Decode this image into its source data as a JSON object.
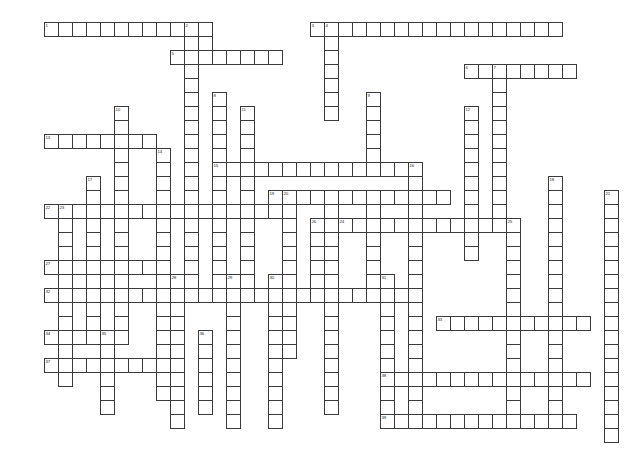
{
  "page": {
    "background_color": "#ffffff",
    "grid_line_color": "#3a3a3a",
    "cell_fill_color": "#ffffff",
    "number_color": "#2b2b2b"
  },
  "grid": {
    "origin_x": 44,
    "origin_y": 22,
    "cell_size": 14,
    "columns": 42,
    "rows": 30,
    "cell_count": 0
  },
  "entries": [
    {
      "number": "1",
      "direction": "across",
      "col": 0,
      "row": 0,
      "length": 11
    },
    {
      "number": "2",
      "direction": "down",
      "col": 10,
      "row": 0,
      "length": 12
    },
    {
      "number": "3",
      "direction": "across",
      "col": 19,
      "row": 0,
      "length": 18
    },
    {
      "number": "4",
      "direction": "down",
      "col": 20,
      "row": 0,
      "length": 6
    },
    {
      "number": "5",
      "direction": "across",
      "col": 9,
      "row": 2,
      "length": 8
    },
    {
      "number": "6",
      "direction": "across",
      "col": 30,
      "row": 3,
      "length": 8
    },
    {
      "number": "7",
      "direction": "down",
      "col": 32,
      "row": 3,
      "length": 9
    },
    {
      "number": "8",
      "direction": "down",
      "col": 12,
      "row": 5,
      "length": 14
    },
    {
      "number": "9",
      "direction": "down",
      "col": 23,
      "row": 5,
      "length": 6
    },
    {
      "number": "10",
      "direction": "down",
      "col": 5,
      "row": 6,
      "length": 15
    },
    {
      "number": "11",
      "direction": "down",
      "col": 14,
      "row": 6,
      "length": 14
    },
    {
      "number": "12",
      "direction": "down",
      "col": 30,
      "row": 6,
      "length": 11
    },
    {
      "number": "13",
      "direction": "across",
      "col": 0,
      "row": 8,
      "length": 8
    },
    {
      "number": "14",
      "direction": "down",
      "col": 8,
      "row": 9,
      "length": 18
    },
    {
      "number": "15",
      "direction": "across",
      "col": 12,
      "row": 10,
      "length": 15
    },
    {
      "number": "16",
      "direction": "down",
      "col": 26,
      "row": 10,
      "length": 14
    },
    {
      "number": "17",
      "direction": "down",
      "col": 3,
      "row": 11,
      "length": 11
    },
    {
      "number": "18",
      "direction": "down",
      "col": 36,
      "row": 11,
      "length": 14
    },
    {
      "number": "19",
      "direction": "across",
      "col": 16,
      "row": 12,
      "length": 13
    },
    {
      "number": "20",
      "direction": "down",
      "col": 17,
      "row": 12,
      "length": 12
    },
    {
      "number": "21",
      "direction": "down",
      "col": 40,
      "row": 12,
      "length": 13
    },
    {
      "number": "22",
      "direction": "across",
      "col": 0,
      "row": 13,
      "length": 17
    },
    {
      "number": "23",
      "direction": "down",
      "col": 1,
      "row": 13,
      "length": 13
    },
    {
      "number": "24",
      "direction": "across",
      "col": 21,
      "row": 14,
      "length": 13
    },
    {
      "number": "25",
      "direction": "down",
      "col": 33,
      "row": 14,
      "length": 12
    },
    {
      "number": "26",
      "direction": "down",
      "col": 19,
      "row": 14,
      "length": 5
    },
    {
      "number": "27",
      "direction": "across",
      "col": 0,
      "row": 17,
      "length": 8
    },
    {
      "number": "28",
      "direction": "down",
      "col": 9,
      "row": 18,
      "length": 11
    },
    {
      "number": "29",
      "direction": "down",
      "col": 13,
      "row": 18,
      "length": 11
    },
    {
      "number": "30",
      "direction": "down",
      "col": 16,
      "row": 18,
      "length": 11
    },
    {
      "number": "31",
      "direction": "down",
      "col": 24,
      "row": 18,
      "length": 10
    },
    {
      "number": "32",
      "direction": "across",
      "col": 0,
      "row": 19,
      "length": 26
    },
    {
      "number": "33",
      "direction": "across",
      "col": 28,
      "row": 21,
      "length": 11
    },
    {
      "number": "34",
      "direction": "across",
      "col": 0,
      "row": 22,
      "length": 6
    },
    {
      "number": "35",
      "direction": "down",
      "col": 4,
      "row": 22,
      "length": 6
    },
    {
      "number": "36",
      "direction": "down",
      "col": 11,
      "row": 22,
      "length": 6
    },
    {
      "number": "37",
      "direction": "across",
      "col": 0,
      "row": 24,
      "length": 10
    },
    {
      "number": "38",
      "direction": "across",
      "col": 24,
      "row": 25,
      "length": 15
    },
    {
      "number": "39",
      "direction": "across",
      "col": 24,
      "row": 28,
      "length": 14
    }
  ],
  "cells": [
    [
      0,
      0
    ],
    [
      1,
      0
    ],
    [
      2,
      0
    ],
    [
      3,
      0
    ],
    [
      4,
      0
    ],
    [
      5,
      0
    ],
    [
      6,
      0
    ],
    [
      7,
      0
    ],
    [
      8,
      0
    ],
    [
      9,
      0
    ],
    [
      10,
      0
    ],
    [
      11,
      0
    ],
    [
      19,
      0
    ],
    [
      20,
      0
    ],
    [
      21,
      0
    ],
    [
      22,
      0
    ],
    [
      23,
      0
    ],
    [
      24,
      0
    ],
    [
      25,
      0
    ],
    [
      26,
      0
    ],
    [
      27,
      0
    ],
    [
      28,
      0
    ],
    [
      29,
      0
    ],
    [
      30,
      0
    ],
    [
      31,
      0
    ],
    [
      32,
      0
    ],
    [
      33,
      0
    ],
    [
      34,
      0
    ],
    [
      35,
      0
    ],
    [
      36,
      0
    ],
    [
      10,
      1
    ],
    [
      11,
      1
    ],
    [
      20,
      1
    ],
    [
      9,
      2
    ],
    [
      10,
      2
    ],
    [
      11,
      2
    ],
    [
      12,
      2
    ],
    [
      13,
      2
    ],
    [
      14,
      2
    ],
    [
      15,
      2
    ],
    [
      16,
      2
    ],
    [
      20,
      2
    ],
    [
      10,
      3
    ],
    [
      20,
      3
    ],
    [
      30,
      3
    ],
    [
      31,
      3
    ],
    [
      32,
      3
    ],
    [
      33,
      3
    ],
    [
      34,
      3
    ],
    [
      35,
      3
    ],
    [
      36,
      3
    ],
    [
      37,
      3
    ],
    [
      10,
      4
    ],
    [
      20,
      4
    ],
    [
      32,
      4
    ],
    [
      10,
      5
    ],
    [
      12,
      5
    ],
    [
      20,
      5
    ],
    [
      23,
      5
    ],
    [
      32,
      5
    ],
    [
      5,
      6
    ],
    [
      10,
      6
    ],
    [
      12,
      6
    ],
    [
      14,
      6
    ],
    [
      20,
      6
    ],
    [
      23,
      6
    ],
    [
      30,
      6
    ],
    [
      32,
      6
    ],
    [
      5,
      7
    ],
    [
      10,
      7
    ],
    [
      12,
      7
    ],
    [
      14,
      7
    ],
    [
      23,
      7
    ],
    [
      30,
      7
    ],
    [
      32,
      7
    ],
    [
      0,
      8
    ],
    [
      1,
      8
    ],
    [
      2,
      8
    ],
    [
      3,
      8
    ],
    [
      4,
      8
    ],
    [
      5,
      8
    ],
    [
      6,
      8
    ],
    [
      7,
      8
    ],
    [
      10,
      8
    ],
    [
      12,
      8
    ],
    [
      14,
      8
    ],
    [
      23,
      8
    ],
    [
      30,
      8
    ],
    [
      32,
      8
    ],
    [
      5,
      9
    ],
    [
      8,
      9
    ],
    [
      10,
      9
    ],
    [
      12,
      9
    ],
    [
      14,
      9
    ],
    [
      23,
      9
    ],
    [
      30,
      9
    ],
    [
      32,
      9
    ],
    [
      5,
      10
    ],
    [
      8,
      10
    ],
    [
      10,
      10
    ],
    [
      12,
      10
    ],
    [
      13,
      10
    ],
    [
      14,
      10
    ],
    [
      15,
      10
    ],
    [
      16,
      10
    ],
    [
      17,
      10
    ],
    [
      18,
      10
    ],
    [
      19,
      10
    ],
    [
      20,
      10
    ],
    [
      21,
      10
    ],
    [
      22,
      10
    ],
    [
      23,
      10
    ],
    [
      24,
      10
    ],
    [
      25,
      10
    ],
    [
      26,
      10
    ],
    [
      30,
      10
    ],
    [
      32,
      10
    ],
    [
      3,
      11
    ],
    [
      5,
      11
    ],
    [
      8,
      11
    ],
    [
      10,
      11
    ],
    [
      12,
      11
    ],
    [
      14,
      11
    ],
    [
      26,
      11
    ],
    [
      30,
      11
    ],
    [
      32,
      11
    ],
    [
      36,
      11
    ],
    [
      3,
      12
    ],
    [
      5,
      12
    ],
    [
      8,
      12
    ],
    [
      10,
      12
    ],
    [
      12,
      12
    ],
    [
      14,
      12
    ],
    [
      16,
      12
    ],
    [
      17,
      12
    ],
    [
      18,
      12
    ],
    [
      19,
      12
    ],
    [
      20,
      12
    ],
    [
      21,
      12
    ],
    [
      22,
      12
    ],
    [
      23,
      12
    ],
    [
      24,
      12
    ],
    [
      25,
      12
    ],
    [
      26,
      12
    ],
    [
      27,
      12
    ],
    [
      28,
      12
    ],
    [
      30,
      12
    ],
    [
      32,
      12
    ],
    [
      36,
      12
    ],
    [
      40,
      12
    ],
    [
      0,
      13
    ],
    [
      1,
      13
    ],
    [
      2,
      13
    ],
    [
      3,
      13
    ],
    [
      4,
      13
    ],
    [
      5,
      13
    ],
    [
      6,
      13
    ],
    [
      7,
      13
    ],
    [
      8,
      13
    ],
    [
      9,
      13
    ],
    [
      10,
      13
    ],
    [
      11,
      13
    ],
    [
      12,
      13
    ],
    [
      13,
      13
    ],
    [
      14,
      13
    ],
    [
      15,
      13
    ],
    [
      16,
      13
    ],
    [
      17,
      13
    ],
    [
      20,
      13
    ],
    [
      23,
      13
    ],
    [
      26,
      13
    ],
    [
      30,
      13
    ],
    [
      32,
      13
    ],
    [
      36,
      13
    ],
    [
      40,
      13
    ],
    [
      1,
      14
    ],
    [
      3,
      14
    ],
    [
      5,
      14
    ],
    [
      8,
      14
    ],
    [
      10,
      14
    ],
    [
      12,
      14
    ],
    [
      14,
      14
    ],
    [
      17,
      14
    ],
    [
      19,
      14
    ],
    [
      20,
      14
    ],
    [
      21,
      14
    ],
    [
      22,
      14
    ],
    [
      23,
      14
    ],
    [
      24,
      14
    ],
    [
      25,
      14
    ],
    [
      26,
      14
    ],
    [
      27,
      14
    ],
    [
      28,
      14
    ],
    [
      29,
      14
    ],
    [
      30,
      14
    ],
    [
      31,
      14
    ],
    [
      32,
      14
    ],
    [
      33,
      14
    ],
    [
      36,
      14
    ],
    [
      40,
      14
    ],
    [
      1,
      15
    ],
    [
      3,
      15
    ],
    [
      5,
      15
    ],
    [
      8,
      15
    ],
    [
      10,
      15
    ],
    [
      12,
      15
    ],
    [
      14,
      15
    ],
    [
      17,
      15
    ],
    [
      19,
      15
    ],
    [
      20,
      15
    ],
    [
      23,
      15
    ],
    [
      26,
      15
    ],
    [
      33,
      15
    ],
    [
      36,
      15
    ],
    [
      40,
      15
    ],
    [
      1,
      16
    ],
    [
      3,
      16
    ],
    [
      5,
      16
    ],
    [
      8,
      16
    ],
    [
      10,
      16
    ],
    [
      12,
      16
    ],
    [
      14,
      16
    ],
    [
      17,
      16
    ],
    [
      19,
      16
    ],
    [
      20,
      16
    ],
    [
      23,
      16
    ],
    [
      26,
      16
    ],
    [
      33,
      16
    ],
    [
      36,
      16
    ],
    [
      40,
      16
    ],
    [
      0,
      17
    ],
    [
      1,
      17
    ],
    [
      2,
      17
    ],
    [
      3,
      17
    ],
    [
      4,
      17
    ],
    [
      5,
      17
    ],
    [
      6,
      17
    ],
    [
      7,
      17
    ],
    [
      8,
      17
    ],
    [
      10,
      17
    ],
    [
      12,
      17
    ],
    [
      14,
      17
    ],
    [
      17,
      17
    ],
    [
      19,
      17
    ],
    [
      20,
      17
    ],
    [
      23,
      17
    ],
    [
      26,
      17
    ],
    [
      33,
      17
    ],
    [
      36,
      17
    ],
    [
      40,
      17
    ],
    [
      1,
      18
    ],
    [
      3,
      18
    ],
    [
      5,
      18
    ],
    [
      8,
      18
    ],
    [
      9,
      18
    ],
    [
      10,
      18
    ],
    [
      12,
      18
    ],
    [
      13,
      18
    ],
    [
      14,
      18
    ],
    [
      16,
      18
    ],
    [
      17,
      18
    ],
    [
      20,
      18
    ],
    [
      23,
      18
    ],
    [
      24,
      18
    ],
    [
      26,
      18
    ],
    [
      33,
      18
    ],
    [
      36,
      18
    ],
    [
      40,
      18
    ],
    [
      0,
      19
    ],
    [
      1,
      19
    ],
    [
      2,
      19
    ],
    [
      3,
      19
    ],
    [
      4,
      19
    ],
    [
      5,
      19
    ],
    [
      6,
      19
    ],
    [
      7,
      19
    ],
    [
      8,
      19
    ],
    [
      9,
      19
    ],
    [
      10,
      19
    ],
    [
      11,
      19
    ],
    [
      12,
      19
    ],
    [
      13,
      19
    ],
    [
      14,
      19
    ],
    [
      15,
      19
    ],
    [
      16,
      19
    ],
    [
      17,
      19
    ],
    [
      18,
      19
    ],
    [
      19,
      19
    ],
    [
      20,
      19
    ],
    [
      21,
      19
    ],
    [
      22,
      19
    ],
    [
      23,
      19
    ],
    [
      24,
      19
    ],
    [
      25,
      19
    ],
    [
      26,
      19
    ],
    [
      33,
      19
    ],
    [
      36,
      19
    ],
    [
      40,
      19
    ],
    [
      1,
      20
    ],
    [
      3,
      20
    ],
    [
      5,
      20
    ],
    [
      9,
      20
    ],
    [
      13,
      20
    ],
    [
      16,
      20
    ],
    [
      20,
      20
    ],
    [
      24,
      20
    ],
    [
      26,
      20
    ],
    [
      33,
      20
    ],
    [
      36,
      20
    ],
    [
      40,
      20
    ],
    [
      1,
      21
    ],
    [
      3,
      21
    ],
    [
      5,
      21
    ],
    [
      9,
      21
    ],
    [
      13,
      21
    ],
    [
      16,
      21
    ],
    [
      20,
      21
    ],
    [
      24,
      21
    ],
    [
      26,
      21
    ],
    [
      28,
      21
    ],
    [
      29,
      21
    ],
    [
      30,
      21
    ],
    [
      31,
      21
    ],
    [
      32,
      21
    ],
    [
      33,
      21
    ],
    [
      34,
      21
    ],
    [
      35,
      21
    ],
    [
      36,
      21
    ],
    [
      37,
      21
    ],
    [
      38,
      21
    ],
    [
      40,
      21
    ],
    [
      0,
      22
    ],
    [
      1,
      22
    ],
    [
      2,
      22
    ],
    [
      3,
      22
    ],
    [
      4,
      22
    ],
    [
      5,
      22
    ],
    [
      9,
      22
    ],
    [
      11,
      22
    ],
    [
      13,
      22
    ],
    [
      16,
      22
    ],
    [
      20,
      22
    ],
    [
      24,
      22
    ],
    [
      26,
      22
    ],
    [
      33,
      22
    ],
    [
      36,
      22
    ],
    [
      40,
      22
    ],
    [
      1,
      23
    ],
    [
      4,
      23
    ],
    [
      9,
      23
    ],
    [
      11,
      23
    ],
    [
      13,
      23
    ],
    [
      16,
      23
    ],
    [
      20,
      23
    ],
    [
      24,
      23
    ],
    [
      26,
      23
    ],
    [
      33,
      23
    ],
    [
      36,
      23
    ],
    [
      40,
      23
    ],
    [
      0,
      24
    ],
    [
      1,
      24
    ],
    [
      2,
      24
    ],
    [
      3,
      24
    ],
    [
      4,
      24
    ],
    [
      5,
      24
    ],
    [
      6,
      24
    ],
    [
      7,
      24
    ],
    [
      8,
      24
    ],
    [
      9,
      24
    ],
    [
      11,
      24
    ],
    [
      13,
      24
    ],
    [
      16,
      24
    ],
    [
      20,
      24
    ],
    [
      24,
      24
    ],
    [
      26,
      24
    ],
    [
      33,
      24
    ],
    [
      36,
      24
    ],
    [
      40,
      24
    ],
    [
      4,
      25
    ],
    [
      9,
      25
    ],
    [
      11,
      25
    ],
    [
      13,
      25
    ],
    [
      16,
      25
    ],
    [
      20,
      25
    ],
    [
      24,
      25
    ],
    [
      25,
      25
    ],
    [
      26,
      25
    ],
    [
      27,
      25
    ],
    [
      28,
      25
    ],
    [
      29,
      25
    ],
    [
      30,
      25
    ],
    [
      31,
      25
    ],
    [
      32,
      25
    ],
    [
      33,
      25
    ],
    [
      34,
      25
    ],
    [
      35,
      25
    ],
    [
      36,
      25
    ],
    [
      37,
      25
    ],
    [
      38,
      25
    ],
    [
      40,
      25
    ],
    [
      4,
      26
    ],
    [
      9,
      26
    ],
    [
      11,
      26
    ],
    [
      13,
      26
    ],
    [
      16,
      26
    ],
    [
      20,
      26
    ],
    [
      24,
      26
    ],
    [
      26,
      26
    ],
    [
      33,
      26
    ],
    [
      36,
      26
    ],
    [
      40,
      26
    ],
    [
      4,
      27
    ],
    [
      9,
      27
    ],
    [
      13,
      27
    ],
    [
      16,
      27
    ],
    [
      20,
      27
    ],
    [
      26,
      27
    ],
    [
      33,
      27
    ],
    [
      36,
      27
    ],
    [
      40,
      27
    ],
    [
      24,
      28
    ],
    [
      25,
      28
    ],
    [
      26,
      28
    ],
    [
      27,
      28
    ],
    [
      28,
      28
    ],
    [
      29,
      28
    ],
    [
      30,
      28
    ],
    [
      31,
      28
    ],
    [
      32,
      28
    ],
    [
      33,
      28
    ],
    [
      34,
      28
    ],
    [
      35,
      28
    ],
    [
      36,
      28
    ],
    [
      37,
      28
    ],
    [
      40,
      28
    ],
    [
      40,
      29
    ]
  ]
}
